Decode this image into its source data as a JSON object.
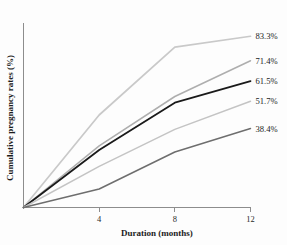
{
  "chart_data": {
    "type": "line",
    "title": "",
    "xlabel": "Duration (months)",
    "ylabel": "Cumulative pregnancy rates (%)",
    "xlim": [
      0,
      12
    ],
    "ylim": [
      0,
      90
    ],
    "xticks": [
      4,
      8,
      12
    ],
    "xticklabels": [
      "4",
      "8",
      "12"
    ],
    "yticks": [],
    "yticklabels": [],
    "grid": false,
    "legend_position": "right-end-labels",
    "x": [
      0,
      4,
      8,
      12
    ],
    "series": [
      {
        "name": "83.3%",
        "label": "83.3%",
        "color": "#c9c9c9",
        "width": 1.7,
        "values": [
          0,
          45.0,
          78.0,
          83.3
        ]
      },
      {
        "name": "71.4%",
        "label": "71.4%",
        "color": "#aeaeae",
        "width": 1.5,
        "values": [
          0,
          30.0,
          54.0,
          71.4
        ]
      },
      {
        "name": "61.5%",
        "label": "61.5%",
        "color": "#1a1a1a",
        "width": 1.8,
        "values": [
          0,
          28.0,
          51.0,
          61.5
        ]
      },
      {
        "name": "51.7%",
        "label": "51.7%",
        "color": "#c4c4c4",
        "width": 1.5,
        "values": [
          0,
          20.0,
          38.0,
          51.7
        ]
      },
      {
        "name": "38.4%",
        "label": "38.4%",
        "color": "#6e6e6e",
        "width": 1.5,
        "values": [
          0,
          9.0,
          27.0,
          38.4
        ]
      }
    ]
  },
  "axis": {
    "x_title": "Duration (months)",
    "y_title": "Cumulative pregnancy rates (%)"
  }
}
